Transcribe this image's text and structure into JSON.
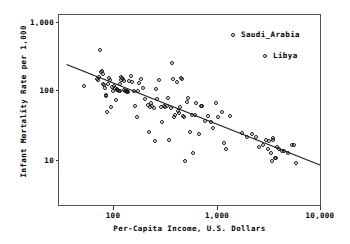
{
  "chart_data": {
    "type": "scatter",
    "title": "",
    "xlabel": "Per-Capita Income, U.S. Dollars",
    "ylabel": "Infant Mortality Rate per 1,000",
    "xscale": "log",
    "yscale": "log",
    "xlim": [
      35,
      11500
    ],
    "ylim": [
      3.0,
      1400
    ],
    "grid": false,
    "xticks": [
      100,
      1000,
      10000
    ],
    "xtick_labels": [
      "100",
      "1,000",
      "10,000"
    ],
    "yticks": [
      10,
      100,
      1000
    ],
    "ytick_labels": [
      "10",
      "100",
      "1,000"
    ],
    "legend_position": "top-right",
    "legend": [
      {
        "label": "Saudi_Arabia",
        "marker": "open-circle"
      },
      {
        "label": "Libya",
        "marker": "open-circle"
      }
    ],
    "marker_style": "open-circle",
    "series": [
      {
        "name": "Countries",
        "points": [
          [
            52,
            118
          ],
          [
            68,
            150
          ],
          [
            70,
            142
          ],
          [
            72,
            160
          ],
          [
            74,
            390
          ],
          [
            75,
            185
          ],
          [
            77,
            190
          ],
          [
            78,
            175
          ],
          [
            79,
            128
          ],
          [
            80,
            120
          ],
          [
            82,
            110
          ],
          [
            83,
            88
          ],
          [
            84,
            84
          ],
          [
            85,
            50
          ],
          [
            88,
            128
          ],
          [
            90,
            155
          ],
          [
            92,
            145
          ],
          [
            94,
            60
          ],
          [
            96,
            115
          ],
          [
            98,
            100
          ],
          [
            100,
            118
          ],
          [
            102,
            112
          ],
          [
            104,
            75
          ],
          [
            106,
            105
          ],
          [
            108,
            108
          ],
          [
            110,
            102
          ],
          [
            112,
            100
          ],
          [
            114,
            100
          ],
          [
            115,
            128
          ],
          [
            116,
            145
          ],
          [
            118,
            160
          ],
          [
            120,
            155
          ],
          [
            122,
            150
          ],
          [
            124,
            140
          ],
          [
            126,
            103
          ],
          [
            128,
            101
          ],
          [
            130,
            100
          ],
          [
            132,
            100
          ],
          [
            134,
            98
          ],
          [
            136,
            97
          ],
          [
            140,
            138
          ],
          [
            145,
            162
          ],
          [
            150,
            135
          ],
          [
            155,
            100
          ],
          [
            160,
            62
          ],
          [
            165,
            43
          ],
          [
            170,
            100
          ],
          [
            175,
            130
          ],
          [
            180,
            150
          ],
          [
            190,
            112
          ],
          [
            200,
            78
          ],
          [
            210,
            64
          ],
          [
            215,
            26
          ],
          [
            220,
            60
          ],
          [
            225,
            68
          ],
          [
            230,
            62
          ],
          [
            240,
            58
          ],
          [
            250,
            19
          ],
          [
            255,
            106
          ],
          [
            260,
            76
          ],
          [
            270,
            145
          ],
          [
            280,
            60
          ],
          [
            290,
            36
          ],
          [
            300,
            62
          ],
          [
            310,
            60
          ],
          [
            320,
            62
          ],
          [
            330,
            80
          ],
          [
            340,
            20
          ],
          [
            350,
            58
          ],
          [
            360,
            250
          ],
          [
            370,
            150
          ],
          [
            380,
            43
          ],
          [
            390,
            45
          ],
          [
            400,
            135
          ],
          [
            410,
            52
          ],
          [
            420,
            48
          ],
          [
            430,
            60
          ],
          [
            440,
            155
          ],
          [
            450,
            150
          ],
          [
            460,
            44
          ],
          [
            470,
            42
          ],
          [
            480,
            10
          ],
          [
            500,
            70
          ],
          [
            520,
            80
          ],
          [
            540,
            26
          ],
          [
            560,
            46
          ],
          [
            580,
            13
          ],
          [
            600,
            46
          ],
          [
            620,
            68
          ],
          [
            650,
            24
          ],
          [
            680,
            62
          ],
          [
            700,
            61
          ],
          [
            750,
            37
          ],
          [
            800,
            44
          ],
          [
            850,
            36
          ],
          [
            900,
            30
          ],
          [
            950,
            68
          ],
          [
            1000,
            42
          ],
          [
            1100,
            50
          ],
          [
            1150,
            18
          ],
          [
            1200,
            15
          ],
          [
            1300,
            44
          ],
          [
            1700,
            25
          ],
          [
            1900,
            22
          ],
          [
            2100,
            24
          ],
          [
            2300,
            22
          ],
          [
            2500,
            16
          ],
          [
            2700,
            17
          ],
          [
            2900,
            20
          ],
          [
            3000,
            15
          ],
          [
            3100,
            19
          ],
          [
            3200,
            13
          ],
          [
            3300,
            10
          ],
          [
            3350,
            21
          ],
          [
            3400,
            20
          ],
          [
            3500,
            11
          ],
          [
            3600,
            11
          ],
          [
            3700,
            16
          ],
          [
            3900,
            15
          ],
          [
            4100,
            14
          ],
          [
            4300,
            14
          ],
          [
            4700,
            13
          ],
          [
            5100,
            17
          ],
          [
            5400,
            17
          ],
          [
            5600,
            9.5
          ]
        ]
      }
    ],
    "trendline": {
      "type": "linear-fit-loglog",
      "start": [
        35,
        240
      ],
      "end": [
        11500,
        8.8
      ]
    },
    "annotations": [
      {
        "label": "Saudi_Arabia",
        "kind": "legend-callout"
      },
      {
        "label": "Libya",
        "kind": "legend-callout"
      }
    ]
  }
}
